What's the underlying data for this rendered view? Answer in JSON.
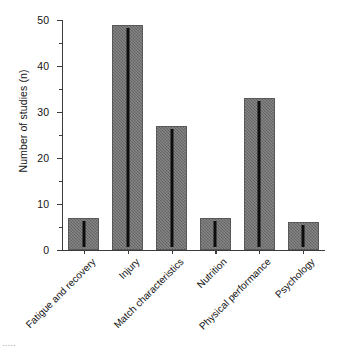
{
  "chart_data": {
    "type": "bar",
    "title": "",
    "xlabel": "",
    "ylabel": "Number of studies (n)",
    "categories": [
      "Fatigue and recovery",
      "Injury",
      "Match characteristics",
      "Nutrition",
      "Physical performance",
      "Psychology"
    ],
    "values": [
      7,
      49,
      27,
      7,
      33,
      6
    ],
    "ylim": [
      0,
      50
    ],
    "ytick_major": [
      0,
      10,
      20,
      30,
      40,
      50
    ],
    "ytick_minor": [
      5,
      15,
      25,
      35,
      45
    ],
    "grid": false,
    "legend": null,
    "bar_color": "#6e6e6e",
    "axis_color": "#3b3b3b",
    "background": "#ffffff",
    "xlabel_rotation_deg": -45,
    "annotations": []
  },
  "figure": {
    "caption_fragment": "....."
  }
}
